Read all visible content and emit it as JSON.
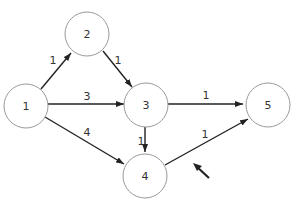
{
  "diagram": {
    "type": "directed-weighted-graph",
    "nodes": [
      {
        "id": "1",
        "label": "1"
      },
      {
        "id": "2",
        "label": "2"
      },
      {
        "id": "3",
        "label": "3"
      },
      {
        "id": "4",
        "label": "4"
      },
      {
        "id": "5",
        "label": "5"
      }
    ],
    "edges": [
      {
        "from": "1",
        "to": "2",
        "weight": "1"
      },
      {
        "from": "2",
        "to": "3",
        "weight": "1"
      },
      {
        "from": "1",
        "to": "3",
        "weight": "3"
      },
      {
        "from": "1",
        "to": "4",
        "weight": "4"
      },
      {
        "from": "3",
        "to": "4",
        "weight": "1"
      },
      {
        "from": "3",
        "to": "5",
        "weight": "1"
      },
      {
        "from": "4",
        "to": "5",
        "weight": "1"
      }
    ],
    "annotation": "pointer-arrow"
  }
}
